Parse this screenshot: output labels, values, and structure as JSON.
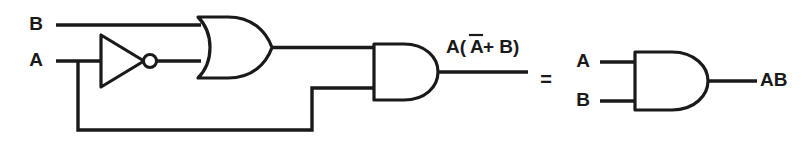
{
  "figure": {
    "name": "logic-circuit-equivalence",
    "stroke_color": "#1a1a1a",
    "background_color": "#ffffff"
  },
  "left_circuit": {
    "inputs": [
      {
        "id": "input-b",
        "label": "B"
      },
      {
        "id": "input-a",
        "label": "A"
      }
    ],
    "gates": [
      {
        "id": "not-gate",
        "type": "NOT",
        "symbol_name": "inverter-triangle-with-bubble"
      },
      {
        "id": "or-gate",
        "type": "OR",
        "symbol_name": "or-gate-shape"
      },
      {
        "id": "and-gate",
        "type": "AND",
        "symbol_name": "and-gate-shape"
      }
    ],
    "output": {
      "id": "output-expression",
      "label_before_paren": "A(",
      "overbar_term": "A",
      "label_after_overbar": " + B)",
      "full_label": "A(A + B)"
    }
  },
  "equals": {
    "label": "="
  },
  "right_circuit": {
    "inputs": [
      {
        "id": "input-a-right",
        "label": "A"
      },
      {
        "id": "input-b-right",
        "label": "B"
      }
    ],
    "gates": [
      {
        "id": "and-gate-right",
        "type": "AND",
        "symbol_name": "and-gate-shape"
      }
    ],
    "output": {
      "id": "output-ab",
      "label": "AB"
    }
  }
}
